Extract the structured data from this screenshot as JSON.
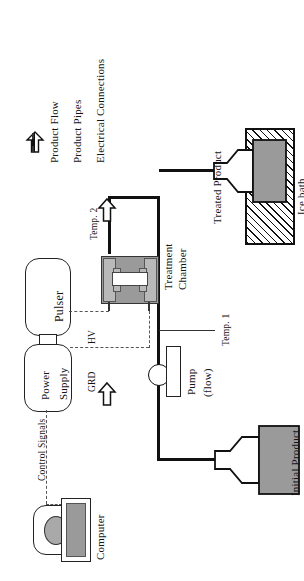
{
  "figure": {
    "orientation": "rotated-90"
  },
  "legend": {
    "items": [
      {
        "symbol": "hollow-up-arrow-icon",
        "label": "Product Flow"
      },
      {
        "symbol": "solid-line-icon",
        "label": "Product Pipes"
      },
      {
        "symbol": "dashed-line-icon",
        "label": "Electrical Connections"
      }
    ]
  },
  "components": {
    "computer": "Computer",
    "power_supply_line1": "Power",
    "power_supply_line2": "Supply",
    "pulser": "Pulser",
    "treatment_chamber_line1": "Treatment",
    "treatment_chamber_line2": "Chamber",
    "pump_line1": "Pump",
    "pump_line2": "(flow)",
    "initial_product": "Initial Product",
    "treated_product": "Treated Product",
    "ice_bath": "Ice bath"
  },
  "connections": {
    "control_signals": "Control Signals",
    "high_voltage": "HV",
    "ground": "GRD",
    "temp_1": "Temp. 1",
    "temp_2": "Temp. 2"
  },
  "colors": {
    "ink": "#111111",
    "fill_gray": "#9a9a9a",
    "fill_light_gray": "#b9b9b9",
    "dash": "#555555",
    "background": "#ffffff"
  }
}
